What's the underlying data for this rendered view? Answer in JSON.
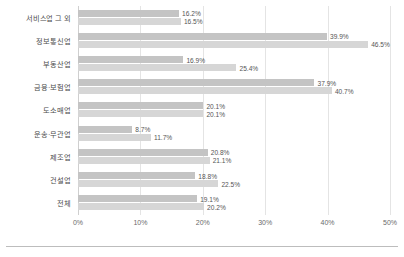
{
  "chart_data": {
    "type": "bar",
    "orientation": "horizontal",
    "title": "",
    "subtitle": "",
    "xlabel": "",
    "ylabel": "",
    "xlim": [
      0,
      50
    ],
    "xticks": [
      "0%",
      "10%",
      "20%",
      "30%",
      "40%",
      "50%"
    ],
    "xtick_values": [
      0,
      10,
      20,
      30,
      40,
      50
    ],
    "grid": true,
    "legend": "none",
    "value_suffix": "%",
    "categories": [
      "서비스업 그 외",
      "정보통신업",
      "부동산업",
      "금융·보험업",
      "도소매업",
      "운송·무관업",
      "제조업",
      "건설업",
      "전체"
    ],
    "series": [
      {
        "name": "series-1",
        "color": "#c4c4c4",
        "values": [
          16.2,
          39.9,
          16.9,
          37.9,
          20.1,
          8.7,
          20.8,
          18.8,
          19.1
        ],
        "labels": [
          "16.2%",
          "39.9%",
          "16.9%",
          "37.9%",
          "20.1%",
          "8.7%",
          "20.8%",
          "18.8%",
          "19.1%"
        ]
      },
      {
        "name": "series-2",
        "color": "#d6d6d6",
        "values": [
          16.5,
          46.5,
          25.4,
          40.7,
          20.1,
          11.7,
          21.1,
          22.5,
          20.2
        ],
        "labels": [
          "16.5%",
          "46.5%",
          "25.4%",
          "40.7%",
          "20.1%",
          "11.7%",
          "21.1%",
          "22.5%",
          "20.2%"
        ]
      }
    ]
  }
}
